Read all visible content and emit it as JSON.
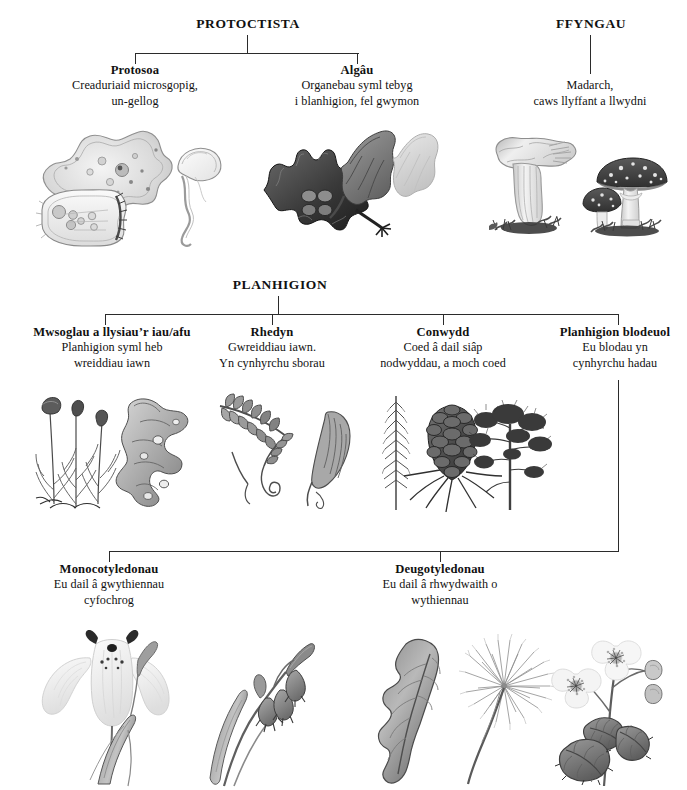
{
  "diagram": {
    "title_hidden": "Classification of living things (Welsh)",
    "kingdoms": [
      {
        "id": "protoctista",
        "label": "PROTOCTISTA"
      },
      {
        "id": "ffyngau",
        "label": "FFYNGAU"
      },
      {
        "id": "planhigion",
        "label": "PLANHIGION"
      }
    ],
    "groups": [
      {
        "id": "protosoa",
        "name": "Protosoa",
        "description_lines": [
          "Creaduriaid microsgopig,",
          "un-gellog"
        ]
      },
      {
        "id": "algau",
        "name": "Algâu",
        "description_lines": [
          "Organebau syml tebyg",
          "i blanhigion, fel gwymon"
        ]
      },
      {
        "id": "madarch",
        "name": "",
        "description_lines": [
          "Madarch,",
          "caws llyffant a llwydni"
        ]
      },
      {
        "id": "mwsoglau",
        "name": "Mwsoglau a llysiau’r iau/afu",
        "description_lines": [
          "Planhigion syml heb",
          "wreiddiau iawn"
        ]
      },
      {
        "id": "rhedyn",
        "name": "Rhedyn",
        "description_lines": [
          "Gwreiddiau iawn.",
          "Yn cynhyrchu sborau"
        ]
      },
      {
        "id": "conwydd",
        "name": "Conwydd",
        "description_lines": [
          "Coed â dail siâp",
          "nodwyddau, a moch coed"
        ]
      },
      {
        "id": "planhigion-blodeuol",
        "name": "Planhigion blodeuol",
        "description_lines": [
          "Eu blodau yn",
          "cynhyrchu hadau"
        ]
      },
      {
        "id": "monocotyledonau",
        "name": "Monocotyledonau",
        "description_lines": [
          "Eu dail â gwythiennau",
          "cyfochrog"
        ]
      },
      {
        "id": "deugotyledonau",
        "name": "Deugotyledonau",
        "description_lines": [
          "Eu dail â rhwydwaith o",
          "wythiennau"
        ]
      }
    ],
    "illustrations": [
      {
        "id": "protosoa-art",
        "name": "amoeba-paramecium-vorticella-illustration"
      },
      {
        "id": "algau-art",
        "name": "seaweed-illustration"
      },
      {
        "id": "ffyngau-art",
        "name": "chanterelle-flyagaric-mushroom-illustration"
      },
      {
        "id": "mwsoglau-art",
        "name": "moss-liverwort-illustration"
      },
      {
        "id": "rhedyn-art",
        "name": "fern-frond-illustration"
      },
      {
        "id": "conwydd-art",
        "name": "conifer-pinecone-illustration"
      },
      {
        "id": "monocot-art",
        "name": "iris-bluebell-illustration"
      },
      {
        "id": "deugot-art",
        "name": "dandelion-bramble-illustration"
      }
    ],
    "line_color": "#2b2b2b",
    "background_color": "#ffffff",
    "text_color": "#111111"
  }
}
